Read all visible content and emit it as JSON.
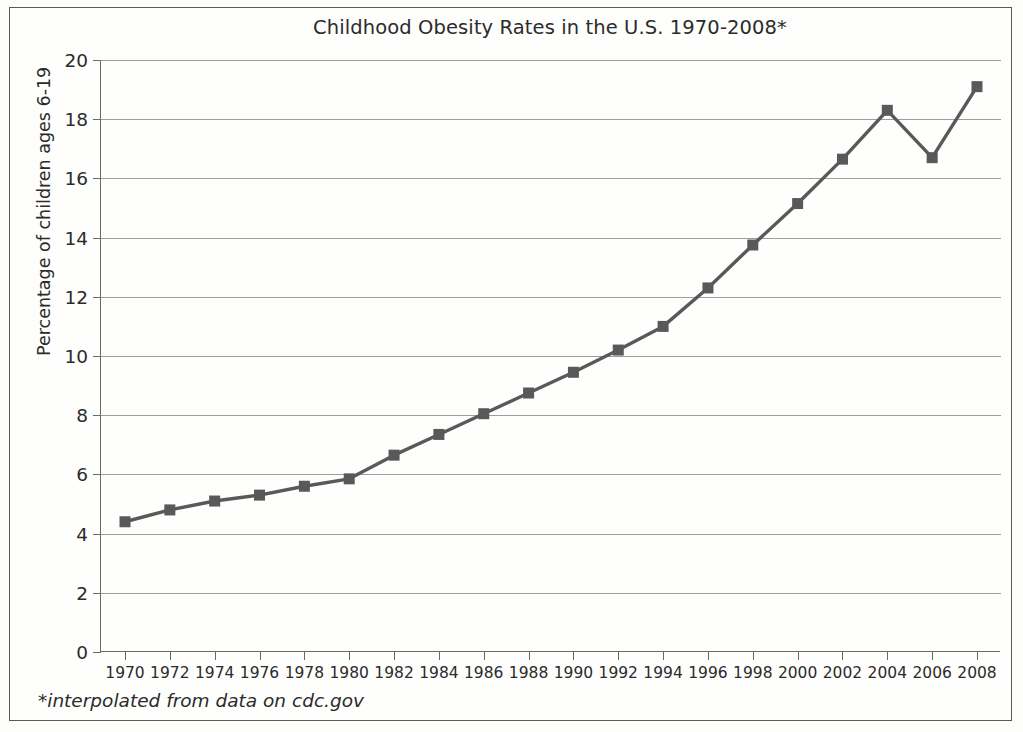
{
  "chart_data": {
    "type": "line",
    "title": "Childhood Obesity Rates in the U.S. 1970-2008*",
    "xlabel": "",
    "ylabel": "Percentage of children ages 6-19",
    "footnote": "*interpolated from data on cdc.gov",
    "x": [
      1970,
      1972,
      1974,
      1976,
      1978,
      1980,
      1982,
      1984,
      1986,
      1988,
      1990,
      1992,
      1994,
      1996,
      1998,
      2000,
      2002,
      2004,
      2006,
      2008
    ],
    "categories": [
      "1970",
      "1972",
      "1974",
      "1976",
      "1978",
      "1980",
      "1982",
      "1984",
      "1986",
      "1988",
      "1990",
      "1992",
      "1994",
      "1996",
      "1998",
      "2000",
      "2002",
      "2004",
      "2006",
      "2008"
    ],
    "values": [
      4.4,
      4.8,
      5.1,
      5.3,
      5.6,
      5.85,
      6.65,
      7.35,
      8.05,
      8.75,
      9.45,
      10.2,
      11.0,
      12.3,
      13.75,
      15.15,
      16.65,
      18.3,
      16.7,
      19.1
    ],
    "series": [
      {
        "name": "Percentage of children ages 6-19",
        "values": [
          4.4,
          4.8,
          5.1,
          5.3,
          5.6,
          5.85,
          6.65,
          7.35,
          8.05,
          8.75,
          9.45,
          10.2,
          11.0,
          12.3,
          13.75,
          15.15,
          16.65,
          18.3,
          16.7,
          19.1
        ],
        "color": "#595959",
        "marker": "square"
      }
    ],
    "ylim": [
      0,
      20
    ],
    "yticks": [
      0,
      2,
      4,
      6,
      8,
      10,
      12,
      14,
      16,
      18,
      20
    ],
    "ytick_labels": [
      "0",
      "2",
      "4",
      "6",
      "8",
      "10",
      "12",
      "14",
      "16",
      "18",
      "20"
    ],
    "xlim": [
      1969,
      2009
    ],
    "grid": "horizontal",
    "legend": "none",
    "line_color": "#595959",
    "grid_color": "#9d9d9d",
    "axis_color": "#6a6a6a",
    "background": "#fefefd"
  }
}
